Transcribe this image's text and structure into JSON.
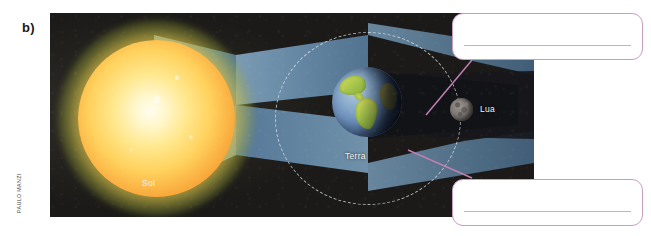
{
  "exercise": {
    "item_label": "b)",
    "credit": "PAULO MANZI"
  },
  "diagram": {
    "type": "lunar-eclipse-schematic",
    "background_color": "#1b1a18",
    "bodies": [
      {
        "name": "sun",
        "label": "Sol",
        "color": "#ffd25e"
      },
      {
        "name": "earth",
        "label": "Terra",
        "color": "#6f93bf"
      },
      {
        "name": "moon",
        "label": "Lua",
        "color": "#827c78"
      }
    ],
    "labels": {
      "sun": "Sol",
      "earth": "Terra",
      "moon": "Lua"
    },
    "light_cone_color": "#6f93b4",
    "orbit_style": "dashed",
    "orbit_color": "#e1ecee",
    "leader_line_color": "#c07fb0"
  },
  "answers": {
    "accent_color": "#c79ec0",
    "rule_color": "#b9b9b9",
    "top": {
      "value": "",
      "placeholder": ""
    },
    "bottom": {
      "value": "",
      "placeholder": ""
    }
  }
}
